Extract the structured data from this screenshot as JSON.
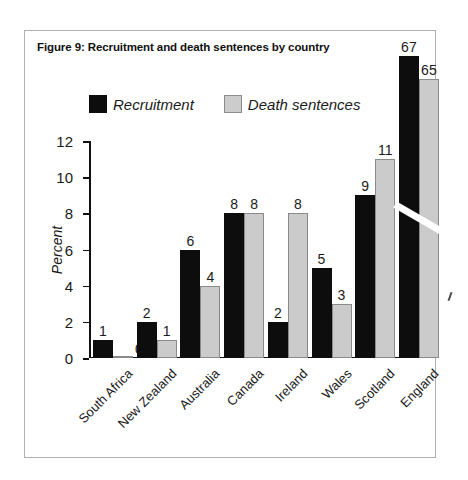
{
  "figure": {
    "title": "Figure 9: Recruitment and death sentences by country"
  },
  "legend": {
    "entries": [
      {
        "label": "Recruitment",
        "color": "#0d0d0d",
        "swatch": "black"
      },
      {
        "label": "Death sentences",
        "color": "#cccccc",
        "swatch": "grey"
      }
    ]
  },
  "axes": {
    "y_title": "Percent",
    "y_ticks": [
      "0",
      "2",
      "4",
      "6",
      "8",
      "10",
      "12"
    ]
  },
  "chart_data": {
    "type": "bar",
    "title": "Figure 9: Recruitment and death sentences by country",
    "xlabel": "",
    "ylabel": "Percent",
    "ylim": [
      0,
      12
    ],
    "grid": false,
    "legend_position": "top-center",
    "axis_break": {
      "present": true,
      "applies_to": "England",
      "note": "England bars are truncated with a diagonal white break slash; their true values exceed the 0-12 axis range."
    },
    "categories": [
      "South Africa",
      "New Zealand",
      "Australia",
      "Canada",
      "Ireland",
      "Wales",
      "Scotland",
      "England"
    ],
    "series": [
      {
        "name": "Recruitment",
        "color": "#0d0d0d",
        "values": [
          1,
          2,
          6,
          8,
          2,
          5,
          9,
          67
        ]
      },
      {
        "name": "Death sentences",
        "color": "#cccccc",
        "values": [
          0,
          1,
          4,
          8,
          8,
          3,
          11,
          65
        ]
      }
    ]
  }
}
